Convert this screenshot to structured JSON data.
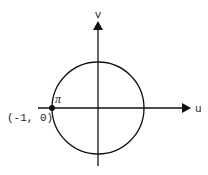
{
  "diagram": {
    "axes": {
      "horizontal_label": "u",
      "vertical_label": "v"
    },
    "circle": {
      "center": [
        0,
        0
      ],
      "radius": 1
    },
    "point": {
      "label": "π",
      "coordinate_label": "(-1, 0)"
    },
    "colors": {
      "stroke": "#111111",
      "background": "#ffffff"
    }
  }
}
